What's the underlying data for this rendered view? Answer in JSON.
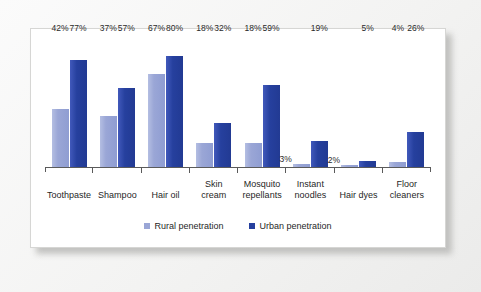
{
  "chart_data": {
    "type": "bar",
    "title": "",
    "subtitle": "",
    "xlabel": "",
    "ylabel": "",
    "ylim": [
      0,
      92
    ],
    "grid": false,
    "legend_position": "bottom-center",
    "categories": [
      "Toothpaste",
      "Shampoo",
      "Hair oil",
      "Skin cream",
      "Mosquito repellants",
      "Instant noodles",
      "Hair dyes",
      "Floor cleaners"
    ],
    "category_lines": [
      [
        "Toothpaste",
        ""
      ],
      [
        "Shampoo",
        ""
      ],
      [
        "Hair oil",
        ""
      ],
      [
        "Skin",
        "cream"
      ],
      [
        "Mosquito",
        "repellants"
      ],
      [
        "Instant",
        "noodles"
      ],
      [
        "Hair dyes",
        ""
      ],
      [
        "Floor",
        "cleaners"
      ]
    ],
    "series": [
      {
        "name": "Rural penetration",
        "color": "#9aa6d6",
        "values": [
          42,
          37,
          67,
          18,
          18,
          3,
          2,
          4
        ],
        "labels": [
          "42%",
          "37%",
          "67%",
          "18%",
          "18%",
          "3%",
          "2%",
          "4%"
        ]
      },
      {
        "name": "Urban penetration",
        "color": "#26409e",
        "values": [
          77,
          57,
          80,
          32,
          59,
          19,
          5,
          26
        ],
        "labels": [
          "77%",
          "57%",
          "80%",
          "32%",
          "59%",
          "19%",
          "5%",
          "26%"
        ]
      }
    ]
  },
  "legend": {
    "items": [
      {
        "label": "Rural penetration",
        "swatch": "rural"
      },
      {
        "label": "Urban penetration",
        "swatch": "urban"
      }
    ]
  }
}
